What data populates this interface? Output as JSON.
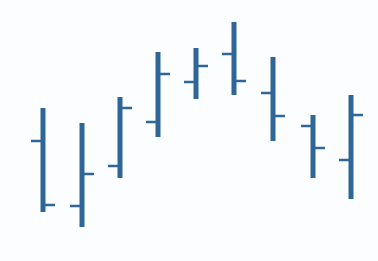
{
  "chart_data": {
    "type": "ohlc",
    "title": "",
    "xlabel": "",
    "ylabel": "",
    "grid": false,
    "legend": null,
    "axes_visible": false,
    "note": "No axes or labels shown; values are relative (inverted pixel scale, higher = up).",
    "color": "#2f6698",
    "categories": [
      "1",
      "2",
      "3",
      "4",
      "5",
      "6",
      "7",
      "8",
      "9"
    ],
    "ylim": [
      0,
      261
    ],
    "bars": [
      {
        "x": 43,
        "open": 120,
        "high": 153,
        "low": 49,
        "close": 56
      },
      {
        "x": 82,
        "open": 55,
        "high": 138,
        "low": 34,
        "close": 87
      },
      {
        "x": 120,
        "open": 95,
        "high": 164,
        "low": 83,
        "close": 153
      },
      {
        "x": 158,
        "open": 139,
        "high": 209,
        "low": 124,
        "close": 187
      },
      {
        "x": 196,
        "open": 179,
        "high": 213,
        "low": 162,
        "close": 195
      },
      {
        "x": 234,
        "open": 207,
        "high": 239,
        "low": 166,
        "close": 180
      },
      {
        "x": 273,
        "open": 168,
        "high": 204,
        "low": 120,
        "close": 145
      },
      {
        "x": 313,
        "open": 135,
        "high": 146,
        "low": 83,
        "close": 113
      },
      {
        "x": 351,
        "open": 101,
        "high": 166,
        "low": 62,
        "close": 146
      }
    ]
  }
}
